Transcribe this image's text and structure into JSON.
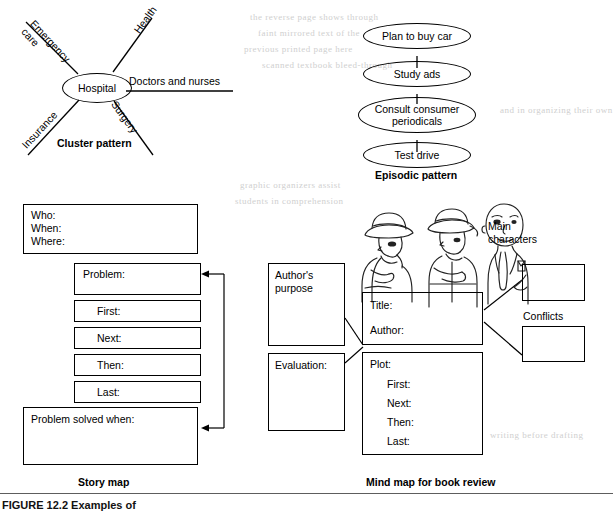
{
  "figure": {
    "caption": "FIGURE 12.2  Examples of",
    "ghost_lines": [
      "the reverse page shows through",
      "faint mirrored text of the",
      "previous printed page here",
      "scanned textbook bleed-through",
      "graphic organizers assist",
      "students in comprehension",
      "and in organizing their own",
      "writing before drafting"
    ]
  },
  "cluster": {
    "caption": "Cluster pattern",
    "center": "Hospital",
    "spokes": [
      {
        "label": "Emergency\ncare",
        "position": "upper-left"
      },
      {
        "label": "Health",
        "position": "upper-right"
      },
      {
        "label": "Doctors and nurses",
        "position": "right"
      },
      {
        "label": "Surgery",
        "position": "lower-right"
      },
      {
        "label": "Insurance",
        "position": "lower-left"
      }
    ]
  },
  "episodic": {
    "caption": "Episodic pattern",
    "steps": [
      "Plan to buy car",
      "Study ads",
      "Consult consumer\nperiodicals",
      "Test drive"
    ]
  },
  "story_map": {
    "caption": "Story map",
    "header_box": {
      "lines": [
        "Who:",
        "When:",
        "Where:"
      ]
    },
    "problem_box": {
      "label": "Problem:"
    },
    "sequence_boxes": [
      {
        "label": "First:"
      },
      {
        "label": "Next:"
      },
      {
        "label": "Then:"
      },
      {
        "label": "Last:"
      }
    ],
    "resolution_box": {
      "label": "Problem solved when:"
    }
  },
  "mind_map": {
    "caption": "Mind map for book review",
    "illustration_name": "three-characters-illustration",
    "main_characters_label": "Main\ncharacters",
    "conflicts_label": "Conflicts",
    "authors_purpose_box": {
      "label": "Author's\npurpose"
    },
    "evaluation_box": {
      "label": "Evaluation:"
    },
    "title_author_box": {
      "lines": [
        "Title:",
        "Author:"
      ]
    },
    "plot_box": {
      "label": "Plot:",
      "items": [
        "First:",
        "Next:",
        "Then:",
        "Last:"
      ]
    },
    "main_characters_box": {
      "label": ""
    },
    "conflicts_box": {
      "label": ""
    }
  }
}
